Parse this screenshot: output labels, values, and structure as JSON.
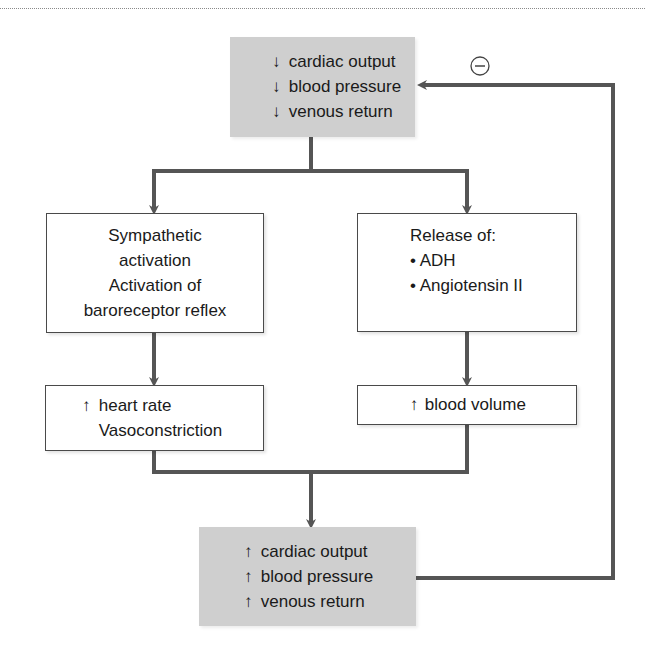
{
  "diagram": {
    "top_box": {
      "lines": [
        {
          "arrow": "↓",
          "text": "cardiac output"
        },
        {
          "arrow": "↓",
          "text": "blood pressure"
        },
        {
          "arrow": "↓",
          "text": "venous return"
        }
      ]
    },
    "left_box": {
      "lines": [
        "Sympathetic",
        "activation",
        "Activation of",
        "baroreceptor reflex"
      ]
    },
    "right_box": {
      "title": "Release of:",
      "bullets": [
        "• ADH",
        "• Angiotensin II"
      ]
    },
    "left_result_box": {
      "lines": [
        {
          "arrow": "↑",
          "text": "heart rate"
        },
        {
          "arrow": "",
          "text": "Vasoconstriction"
        }
      ]
    },
    "right_result_box": {
      "lines": [
        {
          "arrow": "↑",
          "text": "blood volume"
        }
      ]
    },
    "bottom_box": {
      "lines": [
        {
          "arrow": "↑",
          "text": "cardiac output"
        },
        {
          "arrow": "↑",
          "text": "blood pressure"
        },
        {
          "arrow": "↑",
          "text": "venous return"
        }
      ]
    },
    "feedback_sign": "−",
    "colors": {
      "gray_box": "#cfcfcf",
      "line": "#555555",
      "border": "#4a4a4a"
    }
  }
}
